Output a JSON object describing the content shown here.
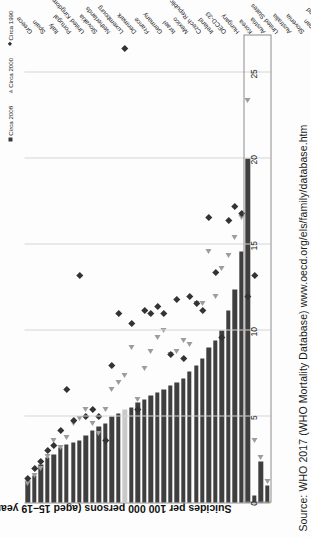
{
  "source": {
    "text": "Source: WHO 2017 (WHO Mortality Database) www.oecd.org/els/family/database.htm"
  },
  "legend": {
    "items": [
      {
        "label": "Circa 2008",
        "marker": "square-marker",
        "color": "#3b3b3b"
      },
      {
        "label": "Circa 2000",
        "marker": "triangle-marker",
        "color": "#9a9a9a"
      },
      {
        "label": "Circa 1990",
        "marker": "diamond-marker",
        "color": "#2f2f2f"
      }
    ]
  },
  "chart_data": {
    "type": "bar",
    "title": "",
    "xlabel": "",
    "ylabel": "Suicides per 100 000 persons (aged 15–19 years)",
    "ylim": [
      0,
      27
    ],
    "ticks": [
      0,
      5,
      10,
      15,
      20,
      25
    ],
    "grid": true,
    "legend_position": "top-right",
    "orientation": "vertical-bars-rotated",
    "highlight_category": "OECD-33",
    "highlight_color": "#c9c9c9",
    "bar_color": "#3f3f3f",
    "group_box_label": "non-OECD countries",
    "group_box_categories": [
      "Russia",
      "China",
      "Brazil",
      "South Africa"
    ],
    "categories": [
      "Greece",
      "Spain",
      "Italy",
      "Portugal",
      "United Kingdom",
      "Slovakia",
      "Netherlands",
      "Luxembourg",
      "Denmark",
      "France",
      "Germany",
      "Israel",
      "Mexico",
      "Czech Republic",
      "Ireland",
      "OECD-33",
      "Hungary",
      "Korea",
      "Austria",
      "United States",
      "Australia",
      "Slovenia",
      "Japan",
      "Switzerland",
      "Belgium",
      "Sweden",
      "Norway",
      "Poland",
      "Estonia",
      "Canada",
      "Chile",
      "Finland",
      "Poland ",
      "New Zealand",
      "Russia",
      "China",
      "Brazil",
      "South Africa"
    ],
    "series": [
      {
        "name": "Circa 2008",
        "marker": "square-bar",
        "values": [
          1.3,
          1.6,
          2.2,
          2.6,
          2.8,
          3.2,
          3.4,
          3.5,
          3.6,
          3.9,
          4.2,
          4.4,
          4.6,
          5.0,
          5.2,
          5.4,
          5.5,
          5.8,
          6.0,
          6.2,
          6.4,
          6.6,
          6.8,
          7.0,
          7.2,
          7.6,
          8.0,
          8.4,
          9.0,
          9.4,
          10.0,
          11.2,
          12.4,
          14.6,
          20.0,
          0.4,
          2.4,
          1.0
        ]
      },
      {
        "name": "Circa 2000",
        "marker": "triangle-marker",
        "values": [
          1.1,
          1.6,
          2.0,
          2.7,
          3.6,
          3.2,
          3.8,
          4.6,
          4.9,
          5.4,
          4.6,
          4.0,
          5.4,
          6.6,
          7.0,
          7.4,
          9.0,
          6.0,
          7.8,
          8.8,
          9.6,
          10.0,
          8.6,
          8.8,
          9.4,
          9.2,
          11.6,
          11.6,
          14.6,
          12.0,
          13.6,
          14.4,
          15.4,
          16.6,
          23.4,
          3.6,
          2.6,
          1.2
        ]
      },
      {
        "name": "Circa 1990",
        "marker": "diamond-marker",
        "values": [
          1.4,
          2.0,
          2.4,
          3.0,
          3.3,
          4.2,
          6.6,
          4.8,
          13.2,
          5.0,
          5.4,
          5.0,
          3.6,
          8.0,
          11.0,
          26.4,
          10.4,
          5.4,
          11.2,
          11.0,
          11.4,
          11.0,
          8.6,
          11.8,
          8.4,
          12.0,
          11.6,
          11.2,
          16.6,
          13.4,
          9.6,
          16.4,
          17.2,
          16.8,
          12.0,
          13.2,
          null,
          null
        ]
      }
    ]
  }
}
